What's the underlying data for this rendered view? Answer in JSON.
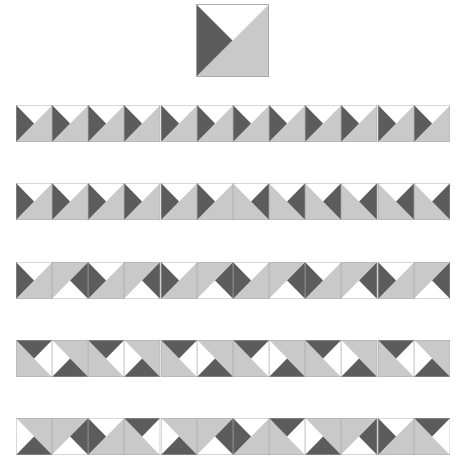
{
  "colors": {
    "white": "#ffffff",
    "dark": "#5c5c5c",
    "light": "#c9c9c9",
    "border": "#a8a8a8"
  },
  "base_tile": {
    "description": "Square split by bottom-left to top-right diagonal: white top triangle, dark left triangle, light gray bottom-right half",
    "x": 196,
    "y": 4,
    "size": 73
  },
  "rows": [
    {
      "name": "row-1-all-same",
      "y": 105,
      "transforms": [
        "r0",
        "r0",
        "r0",
        "r0",
        "r0",
        "r0",
        "r0",
        "r0",
        "r0",
        "r0",
        "r0",
        "r0"
      ]
    },
    {
      "name": "row-2-half-mirrored",
      "y": 183,
      "transforms": [
        "r0",
        "r0",
        "r0",
        "r0",
        "r0",
        "r0",
        "mx",
        "mx",
        "mx",
        "mx",
        "mx",
        "mx"
      ]
    },
    {
      "name": "row-3-alternate-180",
      "y": 262,
      "transforms": [
        "r0",
        "r180",
        "r0",
        "r180",
        "r0",
        "r180",
        "r0",
        "r180",
        "r0",
        "r180",
        "r0",
        "r180"
      ]
    },
    {
      "name": "row-4-alternate-90-270",
      "y": 340,
      "transforms": [
        "r90",
        "r270",
        "r90",
        "r270",
        "r90",
        "r270",
        "r90",
        "r270",
        "r90",
        "r270",
        "r90",
        "r270"
      ]
    },
    {
      "name": "row-5-rotation-cycle",
      "y": 418,
      "transforms": [
        "r270",
        "r180",
        "r0",
        "r90",
        "r270",
        "r180",
        "r0",
        "r90",
        "r270",
        "r180",
        "r0",
        "r90"
      ]
    }
  ]
}
